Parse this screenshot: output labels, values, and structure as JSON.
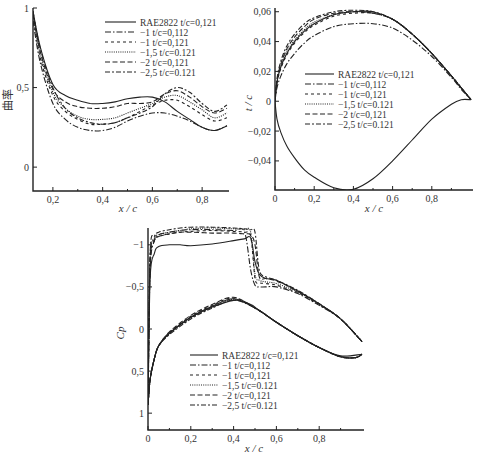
{
  "legend_entries": [
    {
      "label": "RAE2822 t/c=0.121",
      "dash": ""
    },
    {
      "label": "−1 t/c=0.112",
      "dash": "6,2,1.5,2"
    },
    {
      "label": "−1 t/c=0.121",
      "dash": "3,3"
    },
    {
      "label": "−1.5 t/c=0.121",
      "dash": "1,1.2"
    },
    {
      "label": "−2 t/c=0.121",
      "dash": "5,2.5"
    },
    {
      "label": "−2.5 t/c=0.121",
      "dash": "5,2,2,2"
    }
  ],
  "chart_data": [
    {
      "type": "line",
      "title": "",
      "xlabel": "x/c",
      "ylabel": "曲率",
      "xlim": [
        0.12,
        0.9
      ],
      "ylim": [
        -0.15,
        1.0
      ],
      "xticks": [
        "0.2",
        "0.4",
        "0.6",
        "0.8"
      ],
      "yticks": [
        "0",
        "0.5",
        "1"
      ],
      "legend_position": "upper right",
      "x": [
        0.12,
        0.15,
        0.2,
        0.25,
        0.3,
        0.35,
        0.4,
        0.45,
        0.5,
        0.55,
        0.6,
        0.65,
        0.7,
        0.75,
        0.8,
        0.85,
        0.9
      ],
      "series": [
        {
          "name": "RAE2822 t/c=0.121",
          "values": [
            0.98,
            0.75,
            0.52,
            0.45,
            0.42,
            0.4,
            0.4,
            0.41,
            0.43,
            0.44,
            0.44,
            0.41,
            0.35,
            0.3,
            0.25,
            0.23,
            0.26
          ]
        },
        {
          "name": "-1 t/c=0.112",
          "values": [
            0.92,
            0.65,
            0.4,
            0.3,
            0.25,
            0.23,
            0.23,
            0.25,
            0.29,
            0.32,
            0.34,
            0.34,
            0.32,
            0.29,
            0.25,
            0.23,
            0.26
          ]
        },
        {
          "name": "-1 t/c=0.121",
          "values": [
            0.95,
            0.68,
            0.45,
            0.35,
            0.3,
            0.27,
            0.27,
            0.28,
            0.31,
            0.35,
            0.39,
            0.42,
            0.42,
            0.38,
            0.33,
            0.29,
            0.31
          ]
        },
        {
          "name": "-1.5 t/c=0.121",
          "values": [
            0.96,
            0.7,
            0.47,
            0.37,
            0.32,
            0.3,
            0.3,
            0.31,
            0.34,
            0.37,
            0.4,
            0.44,
            0.45,
            0.41,
            0.36,
            0.31,
            0.34
          ]
        },
        {
          "name": "-2 t/c=0.121",
          "values": [
            0.97,
            0.72,
            0.49,
            0.41,
            0.38,
            0.37,
            0.37,
            0.38,
            0.4,
            0.4,
            0.41,
            0.46,
            0.48,
            0.44,
            0.38,
            0.34,
            0.37
          ]
        },
        {
          "name": "-2.5 t/c=0.121",
          "values": [
            0.98,
            0.74,
            0.5,
            0.37,
            0.31,
            0.28,
            0.27,
            0.28,
            0.31,
            0.34,
            0.38,
            0.46,
            0.5,
            0.47,
            0.4,
            0.35,
            0.39
          ]
        }
      ]
    },
    {
      "type": "line",
      "title": "",
      "xlabel": "x/c",
      "ylabel": "t/c",
      "xlim": [
        0,
        1.0
      ],
      "ylim": [
        -0.06,
        0.062
      ],
      "xticks": [
        "0",
        "0.2",
        "0.4",
        "0.6",
        "0.8"
      ],
      "yticks": [
        "-0.04",
        "-0.02",
        "0",
        "0.02",
        "0.04",
        "0.06"
      ],
      "legend_position": "center",
      "x": [
        0,
        0.01,
        0.03,
        0.06,
        0.1,
        0.15,
        0.2,
        0.3,
        0.4,
        0.5,
        0.6,
        0.7,
        0.8,
        0.9,
        0.95,
        1.0
      ],
      "series": [
        {
          "name": "RAE2822 t/c=0.121 (upper)",
          "values": [
            0,
            0.013,
            0.023,
            0.032,
            0.04,
            0.047,
            0.052,
            0.058,
            0.06,
            0.06,
            0.055,
            0.045,
            0.032,
            0.017,
            0.009,
            0.001
          ]
        },
        {
          "name": "RAE2822 t/c=0.121 (lower)",
          "values": [
            0,
            -0.012,
            -0.021,
            -0.03,
            -0.038,
            -0.046,
            -0.051,
            -0.058,
            -0.059,
            -0.052,
            -0.04,
            -0.026,
            -0.012,
            -0.002,
            0.001,
            0.001
          ]
        },
        {
          "name": "-1 t/c=0.112",
          "values": [
            0,
            0.009,
            0.017,
            0.025,
            0.032,
            0.039,
            0.044,
            0.05,
            0.052,
            0.052,
            0.049,
            0.041,
            0.03,
            0.016,
            0.008,
            0.001
          ]
        },
        {
          "name": "-1 t/c=0.121",
          "values": [
            0,
            0.012,
            0.022,
            0.031,
            0.039,
            0.046,
            0.051,
            0.057,
            0.059,
            0.059,
            0.055,
            0.045,
            0.032,
            0.017,
            0.009,
            0.001
          ]
        },
        {
          "name": "-1.5 t/c=0.121",
          "values": [
            0,
            0.013,
            0.024,
            0.033,
            0.041,
            0.048,
            0.053,
            0.058,
            0.06,
            0.059,
            0.055,
            0.045,
            0.032,
            0.017,
            0.009,
            0.001
          ]
        },
        {
          "name": "-2 t/c=0.121",
          "values": [
            0,
            0.014,
            0.025,
            0.035,
            0.043,
            0.05,
            0.055,
            0.059,
            0.06,
            0.059,
            0.055,
            0.045,
            0.032,
            0.017,
            0.009,
            0.001
          ]
        },
        {
          "name": "-2.5 t/c=0.121",
          "values": [
            0,
            0.015,
            0.027,
            0.037,
            0.045,
            0.052,
            0.056,
            0.06,
            0.061,
            0.06,
            0.055,
            0.045,
            0.032,
            0.017,
            0.009,
            0.001
          ]
        }
      ]
    },
    {
      "type": "line",
      "title": "",
      "xlabel": "x/c",
      "ylabel": "C_p",
      "xlim": [
        0,
        1.0
      ],
      "ylim": [
        1.2,
        -1.2
      ],
      "y_inverted": true,
      "xticks": [
        "0",
        "0.2",
        "0.4",
        "0.6",
        "0.8"
      ],
      "yticks": [
        "-1",
        "-0.5",
        "0",
        "0.5",
        "1"
      ],
      "legend_position": "lower center",
      "x": [
        0,
        0.01,
        0.03,
        0.05,
        0.1,
        0.15,
        0.2,
        0.3,
        0.4,
        0.45,
        0.48,
        0.5,
        0.52,
        0.55,
        0.6,
        0.7,
        0.8,
        0.9,
        1.0
      ],
      "series": [
        {
          "name": "RAE2822 t/c=0.121 (upper)",
          "values": [
            0.9,
            -0.6,
            -0.9,
            -0.98,
            -1.0,
            -1.0,
            -0.99,
            -1.01,
            -1.05,
            -1.07,
            -1.08,
            -0.8,
            -0.65,
            -0.6,
            -0.58,
            -0.45,
            -0.3,
            -0.12,
            0.15
          ]
        },
        {
          "name": "RAE2822 t/c=0.121 (lower)",
          "values": [
            0.9,
            0.6,
            0.35,
            0.2,
            0.05,
            -0.05,
            -0.14,
            -0.26,
            -0.34,
            -0.32,
            -0.29,
            -0.26,
            -0.22,
            -0.17,
            -0.08,
            0.08,
            0.22,
            0.32,
            0.3
          ]
        },
        {
          "name": "-1 t/c=0.112",
          "values": [
            0.9,
            -0.7,
            -1.05,
            -1.12,
            -1.15,
            -1.17,
            -1.18,
            -1.18,
            -1.17,
            -1.16,
            -0.7,
            -0.52,
            -0.5,
            -0.5,
            -0.5,
            -0.42,
            -0.28,
            -0.12,
            0.15
          ]
        },
        {
          "name": "-1 t/c=0.121",
          "values": [
            0.9,
            -0.75,
            -1.05,
            -1.1,
            -1.13,
            -1.15,
            -1.16,
            -1.17,
            -1.16,
            -1.15,
            -1.1,
            -0.6,
            -0.55,
            -0.54,
            -0.52,
            -0.43,
            -0.29,
            -0.12,
            0.15
          ]
        },
        {
          "name": "-1.5 t/c=0.121",
          "values": [
            0.9,
            -0.8,
            -1.08,
            -1.12,
            -1.15,
            -1.17,
            -1.19,
            -1.2,
            -1.19,
            -1.18,
            -1.15,
            -0.65,
            -0.58,
            -0.56,
            -0.54,
            -0.44,
            -0.29,
            -0.12,
            0.15
          ]
        },
        {
          "name": "-2 t/c=0.121",
          "values": [
            0.9,
            -0.85,
            -1.05,
            -1.1,
            -1.13,
            -1.15,
            -1.15,
            -1.14,
            -1.14,
            -1.13,
            -1.12,
            -1.0,
            -0.62,
            -0.6,
            -0.57,
            -0.45,
            -0.3,
            -0.12,
            0.15
          ]
        },
        {
          "name": "-2.5 t/c=0.121",
          "values": [
            0.9,
            -0.9,
            -1.1,
            -1.15,
            -1.18,
            -1.2,
            -1.21,
            -1.21,
            -1.2,
            -1.19,
            -1.18,
            -1.15,
            -0.7,
            -0.62,
            -0.58,
            -0.46,
            -0.3,
            -0.12,
            0.15
          ]
        }
      ],
      "lower_surface_band": {
        "x": [
          0,
          0.01,
          0.03,
          0.05,
          0.1,
          0.2,
          0.3,
          0.4,
          0.5,
          0.6,
          0.7,
          0.8,
          0.9,
          0.97,
          1.0
        ],
        "values": [
          0.9,
          0.6,
          0.35,
          0.2,
          0.05,
          -0.14,
          -0.27,
          -0.36,
          -0.25,
          -0.08,
          0.08,
          0.22,
          0.33,
          0.34,
          0.3
        ]
      }
    }
  ]
}
